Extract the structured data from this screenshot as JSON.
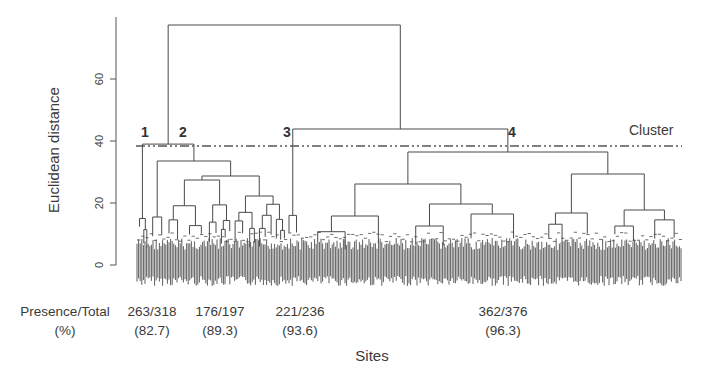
{
  "chart_data": {
    "type": "dendrogram",
    "title": "",
    "xlabel": "Sites",
    "ylabel": "Euclidean distance",
    "ylim": [
      0,
      78
    ],
    "yticks": [
      0,
      20,
      40,
      60
    ],
    "grid": false,
    "cut_line": {
      "label": "Cluster",
      "height": 38,
      "style": "dash-dot-dot"
    },
    "root_height": 78,
    "merges": [
      {
        "name": "root",
        "height": 78,
        "children": [
          "clusters-1-2",
          "clusters-3-4"
        ]
      },
      {
        "name": "clusters-1-2",
        "height": 39,
        "children": [
          "cluster-1",
          "cluster-2"
        ]
      },
      {
        "name": "clusters-3-4",
        "height": 44,
        "children": [
          "cluster-3",
          "cluster-4"
        ]
      },
      {
        "name": "cluster-2",
        "height": 33
      },
      {
        "name": "cluster-4",
        "height": 37
      },
      {
        "name": "cluster-3",
        "height": 16
      },
      {
        "name": "cluster-1",
        "height": 15
      }
    ],
    "clusters": [
      {
        "id": "1",
        "presence": 263,
        "total": 318,
        "percent": 82.7
      },
      {
        "id": "2",
        "presence": 176,
        "total": 197,
        "percent": 89.3
      },
      {
        "id": "3",
        "presence": 221,
        "total": 236,
        "percent": 93.6
      },
      {
        "id": "4",
        "presence": 362,
        "total": 376,
        "percent": 96.3
      }
    ]
  },
  "labels": {
    "ylabel": "Euclidean distance",
    "xlabel": "Sites",
    "cluster_line": "Cluster",
    "row_header_1": "Presence/Total",
    "row_header_2": "(%)",
    "yticks": [
      "0",
      "20",
      "40",
      "60"
    ],
    "cluster_numbers": [
      "1",
      "2",
      "3",
      "4"
    ],
    "ratios": [
      "263/318",
      "176/197",
      "221/236",
      "362/376"
    ],
    "percents": [
      "(82.7)",
      "(89.3)",
      "(93.6)",
      "(96.3)"
    ]
  },
  "colors": {
    "line": "#4a4a4a",
    "leaves": "#2e2e2e",
    "text": "#3a3a3a"
  }
}
